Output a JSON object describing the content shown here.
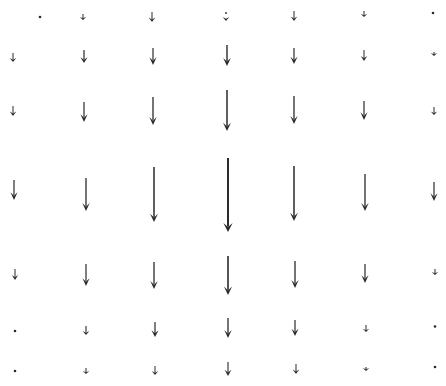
{
  "figure": {
    "type": "vector-field",
    "width": 446,
    "height": 386,
    "color": "#2a2a2a",
    "background": "#ffffff",
    "columns_x": [
      13,
      85,
      153,
      227,
      294,
      364,
      434
    ],
    "rows_y": [
      17,
      55,
      110,
      195,
      275,
      328,
      370
    ],
    "direction": "down",
    "arrows": [
      [
        {
          "x": 40,
          "y1": 16,
          "y2": 18,
          "w": 1.0
        },
        {
          "x": 83,
          "y1": 14,
          "y2": 20,
          "w": 1.0
        },
        {
          "x": 152,
          "y1": 12,
          "y2": 22,
          "w": 1.0
        },
        {
          "x": 226,
          "y1": 12,
          "y2": 21,
          "w": 1.0,
          "dotted": true
        },
        {
          "x": 294,
          "y1": 11,
          "y2": 21,
          "w": 1.0
        },
        {
          "x": 364,
          "y1": 11,
          "y2": 17,
          "w": 1.0
        },
        {
          "x": 433,
          "y1": 12,
          "y2": 14,
          "w": 1.0
        }
      ],
      [
        {
          "x": 13,
          "y1": 53,
          "y2": 62,
          "w": 1.0
        },
        {
          "x": 84,
          "y1": 50,
          "y2": 63,
          "w": 1.2
        },
        {
          "x": 153,
          "y1": 48,
          "y2": 65,
          "w": 1.2
        },
        {
          "x": 227,
          "y1": 45,
          "y2": 66,
          "w": 1.4
        },
        {
          "x": 294,
          "y1": 48,
          "y2": 64,
          "w": 1.2
        },
        {
          "x": 364,
          "y1": 50,
          "y2": 61,
          "w": 1.0
        },
        {
          "x": 434,
          "y1": 52,
          "y2": 56,
          "w": 1.0
        }
      ],
      [
        {
          "x": 13,
          "y1": 106,
          "y2": 116,
          "w": 1.0
        },
        {
          "x": 84,
          "y1": 102,
          "y2": 122,
          "w": 1.2
        },
        {
          "x": 153,
          "y1": 97,
          "y2": 125,
          "w": 1.3
        },
        {
          "x": 227,
          "y1": 90,
          "y2": 131,
          "w": 1.5
        },
        {
          "x": 294,
          "y1": 96,
          "y2": 124,
          "w": 1.3
        },
        {
          "x": 364,
          "y1": 101,
          "y2": 120,
          "w": 1.2
        },
        {
          "x": 434,
          "y1": 107,
          "y2": 115,
          "w": 1.0
        }
      ],
      [
        {
          "x": 14,
          "y1": 180,
          "y2": 200,
          "w": 1.2
        },
        {
          "x": 86,
          "y1": 178,
          "y2": 211,
          "w": 1.3
        },
        {
          "x": 154,
          "y1": 167,
          "y2": 222,
          "w": 1.5
        },
        {
          "x": 228,
          "y1": 158,
          "y2": 232,
          "w": 2.0
        },
        {
          "x": 294,
          "y1": 166,
          "y2": 221,
          "w": 1.5
        },
        {
          "x": 365,
          "y1": 174,
          "y2": 211,
          "w": 1.3
        },
        {
          "x": 434,
          "y1": 182,
          "y2": 201,
          "w": 1.2
        }
      ],
      [
        {
          "x": 15,
          "y1": 269,
          "y2": 280,
          "w": 1.0
        },
        {
          "x": 86,
          "y1": 264,
          "y2": 286,
          "w": 1.2
        },
        {
          "x": 154,
          "y1": 262,
          "y2": 289,
          "w": 1.3
        },
        {
          "x": 228,
          "y1": 256,
          "y2": 295,
          "w": 1.6
        },
        {
          "x": 295,
          "y1": 261,
          "y2": 288,
          "w": 1.3
        },
        {
          "x": 365,
          "y1": 264,
          "y2": 283,
          "w": 1.2
        },
        {
          "x": 435,
          "y1": 269,
          "y2": 275,
          "w": 1.0
        }
      ],
      [
        {
          "x": 15,
          "y1": 330,
          "y2": 332,
          "w": 1.0
        },
        {
          "x": 86,
          "y1": 326,
          "y2": 335,
          "w": 1.1
        },
        {
          "x": 155,
          "y1": 322,
          "y2": 337,
          "w": 1.2
        },
        {
          "x": 228,
          "y1": 318,
          "y2": 338,
          "w": 1.3
        },
        {
          "x": 295,
          "y1": 320,
          "y2": 336,
          "w": 1.2
        },
        {
          "x": 366,
          "y1": 325,
          "y2": 332,
          "w": 1.0
        },
        {
          "x": 435,
          "y1": 325,
          "y2": 328,
          "w": 1.0
        }
      ],
      [
        {
          "x": 15,
          "y1": 370,
          "y2": 372,
          "w": 1.0
        },
        {
          "x": 86,
          "y1": 368,
          "y2": 374,
          "w": 1.0
        },
        {
          "x": 155,
          "y1": 366,
          "y2": 375,
          "w": 1.0
        },
        {
          "x": 228,
          "y1": 362,
          "y2": 376,
          "w": 1.1
        },
        {
          "x": 296,
          "y1": 364,
          "y2": 374,
          "w": 1.0
        },
        {
          "x": 366,
          "y1": 367,
          "y2": 371,
          "w": 1.0
        },
        {
          "x": 435,
          "y1": 366,
          "y2": 368,
          "w": 1.0
        }
      ]
    ]
  }
}
